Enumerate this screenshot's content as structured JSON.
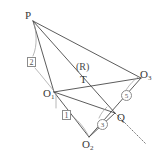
{
  "figure": {
    "stroke_color": "#4a4a4a",
    "leader_color": "#9a9a9a",
    "background_color": "#ffffff",
    "points": [
      {
        "id": "P",
        "label": "P",
        "sub": "",
        "x": 30,
        "y": 17
      },
      {
        "id": "O1",
        "label": "O",
        "sub": "1",
        "x": 52,
        "y": 95
      },
      {
        "id": "T",
        "label": "T",
        "sub": "",
        "x": 83,
        "y": 81
      },
      {
        "id": "R",
        "label": "(R)",
        "sub": "",
        "x": 83,
        "y": 70
      },
      {
        "id": "O3",
        "label": "O",
        "sub": "3",
        "x": 139,
        "y": 74
      },
      {
        "id": "Q",
        "label": "Q",
        "sub": "",
        "x": 113,
        "y": 116
      },
      {
        "id": "O2",
        "label": "O",
        "sub": "2",
        "x": 88,
        "y": 142
      }
    ],
    "labels": {
      "P": "P",
      "O1": "O",
      "O1_sub": "1",
      "T": "T",
      "R": "(R)",
      "O3": "O",
      "O3_sub": "3",
      "Q": "Q",
      "O2": "O",
      "O2_sub": "2"
    },
    "callouts": [
      {
        "id": "c2",
        "style": "boxed",
        "text": "2",
        "x": 27,
        "y": 57
      },
      {
        "id": "c1",
        "style": "boxed",
        "text": "1",
        "x": 62,
        "y": 110
      },
      {
        "id": "c3",
        "style": "circled",
        "text": "3",
        "x": 98,
        "y": 119
      },
      {
        "id": "c5",
        "style": "circled",
        "text": "5",
        "x": 122,
        "y": 91
      }
    ],
    "segments": [
      {
        "name": "P-O1",
        "from": "P",
        "to": "O1"
      },
      {
        "name": "P-Q",
        "from": "P",
        "to": "Q"
      },
      {
        "name": "P-O3",
        "from": "P",
        "to": "O3"
      },
      {
        "name": "O1-O3",
        "from": "O1",
        "to": "O3"
      },
      {
        "name": "O1-O2",
        "from": "O1",
        "to": "O2"
      },
      {
        "name": "O1-Q",
        "from": "O1",
        "to": "Q"
      },
      {
        "name": "O2-O3",
        "from": "O2",
        "to": "O3"
      },
      {
        "name": "O2-Q-extend",
        "from": "O2",
        "to": "extend"
      }
    ]
  }
}
